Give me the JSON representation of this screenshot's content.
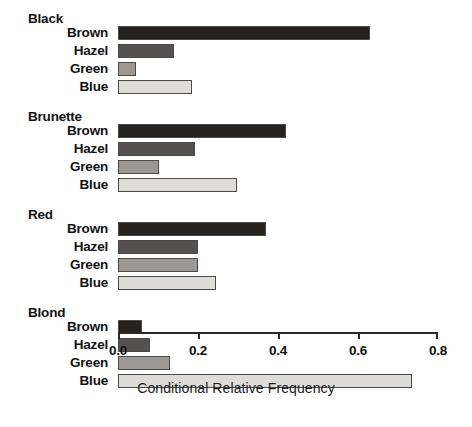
{
  "chart_data": {
    "type": "bar",
    "orientation": "horizontal",
    "title": "",
    "xlabel": "Conditional Relative Frequency",
    "ylabel": "",
    "xlim": [
      0.0,
      0.8
    ],
    "xticks": [
      "0.0",
      "0.2",
      "0.4",
      "0.6",
      "0.8"
    ],
    "xtick_values": [
      0.0,
      0.2,
      0.4,
      0.6,
      0.8
    ],
    "grid": false,
    "legend": "none",
    "categories": [
      "Brown",
      "Hazel",
      "Green",
      "Blue"
    ],
    "groups": [
      {
        "name": "Black",
        "bars": [
          {
            "label": "Brown",
            "value": 0.63,
            "color": "#262220"
          },
          {
            "label": "Hazel",
            "value": 0.14,
            "color": "#555050"
          },
          {
            "label": "Green",
            "value": 0.044,
            "color": "#9b9896"
          },
          {
            "label": "Blue",
            "value": 0.185,
            "color": "#dedcd8"
          }
        ]
      },
      {
        "name": "Brunette",
        "bars": [
          {
            "label": "Brown",
            "value": 0.42,
            "color": "#262220"
          },
          {
            "label": "Hazel",
            "value": 0.193,
            "color": "#555050"
          },
          {
            "label": "Green",
            "value": 0.103,
            "color": "#9b9896"
          },
          {
            "label": "Blue",
            "value": 0.298,
            "color": "#dedcd8"
          }
        ]
      },
      {
        "name": "Red",
        "bars": [
          {
            "label": "Brown",
            "value": 0.37,
            "color": "#262220"
          },
          {
            "label": "Hazel",
            "value": 0.2,
            "color": "#555050"
          },
          {
            "label": "Green",
            "value": 0.2,
            "color": "#9b9896"
          },
          {
            "label": "Blue",
            "value": 0.245,
            "color": "#dedcd8"
          }
        ]
      },
      {
        "name": "Blond",
        "bars": [
          {
            "label": "Brown",
            "value": 0.06,
            "color": "#262220"
          },
          {
            "label": "Hazel",
            "value": 0.08,
            "color": "#555050"
          },
          {
            "label": "Green",
            "value": 0.13,
            "color": "#9b9896"
          },
          {
            "label": "Blue",
            "value": 0.735,
            "color": "#dedcd8"
          }
        ]
      }
    ]
  },
  "layout": {
    "axis_left_px": 118,
    "axis_right_px": 438,
    "plot_top_px": 26,
    "bar_height_px": 14,
    "bar_gap_px": 4,
    "group_header_px": 18,
    "group_gap_px": 12,
    "bar_border_color": "#4a4a4a",
    "axis_color": "#2b2b2b",
    "background": "#ffffff"
  }
}
